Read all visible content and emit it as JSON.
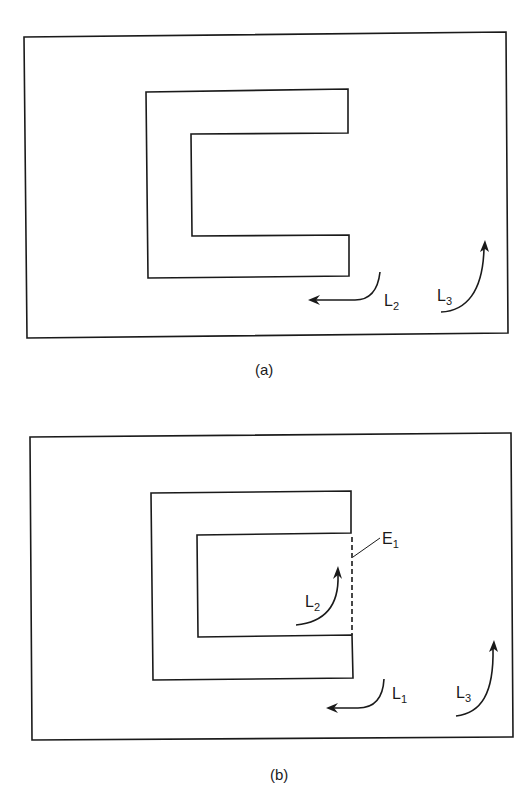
{
  "panels": [
    {
      "caption": "(a)",
      "labels": {
        "L2": {
          "main": "L",
          "sub": "2"
        },
        "L3": {
          "main": "L",
          "sub": "3"
        }
      }
    },
    {
      "caption": "(b)",
      "labels": {
        "E1": {
          "main": "E",
          "sub": "1"
        },
        "L1": {
          "main": "L",
          "sub": "1"
        },
        "L2": {
          "main": "L",
          "sub": "2"
        },
        "L3": {
          "main": "L",
          "sub": "3"
        }
      }
    }
  ],
  "colors": {
    "line": "#1a1a1a",
    "background": "#ffffff"
  }
}
